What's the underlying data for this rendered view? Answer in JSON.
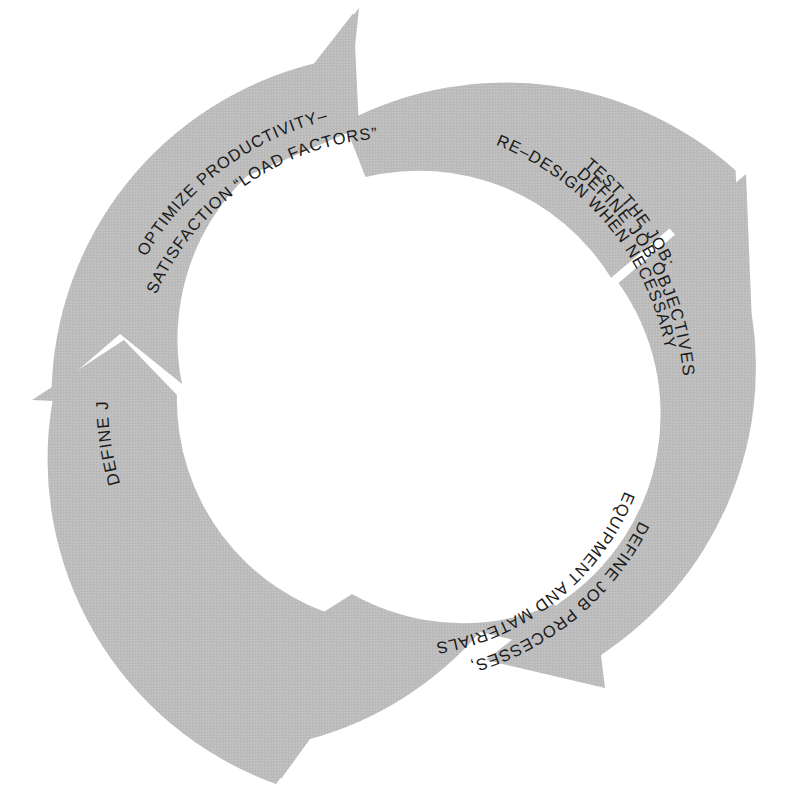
{
  "diagram": {
    "type": "cyclic-process-diagram",
    "title": "",
    "orientation": "clockwise",
    "segment_count": 5,
    "colors": {
      "background": "#ffffff",
      "arrow_fill": "#bcbcbc",
      "arrow_fill_texture": "#c2c2c2",
      "text": "#1a1a1a",
      "gap": "#ffffff"
    },
    "geometry": {
      "center_x": 396,
      "center_y": 400,
      "outer_radius": 345,
      "inner_radius": 226
    },
    "segments": [
      {
        "id": "define-job-objectives",
        "order": 1,
        "label_lines": [
          "DEFINE JOB OBJECTIVES"
        ],
        "label_full": "DEFINE JOB OBJECTIVES",
        "position": "top-right",
        "start_angle_deg": -78,
        "end_angle_deg": -8
      },
      {
        "id": "define-job-conditions",
        "order": 2,
        "label_lines": [
          "DEFINE JOB CONDITIONS"
        ],
        "label_full": "DEFINE JOB CONDITIONS",
        "position": "right",
        "start_angle_deg": -4,
        "end_angle_deg": 62
      },
      {
        "id": "define-job-processes",
        "order": 3,
        "label_lines": [
          "DEFINE JOB PROCESSES,",
          "EQUIPMENT AND MATERIALS"
        ],
        "label_full": "DEFINE JOB PROCESSES, EQUIPMENT AND MATERIALS",
        "position": "bottom",
        "start_angle_deg": 66,
        "end_angle_deg": 140
      },
      {
        "id": "optimize-productivity",
        "order": 4,
        "label_lines": [
          "OPTIMIZE PRODUCTIVITY–",
          "SATISFACTION “LOAD FACTORS”"
        ],
        "label_full": "OPTIMIZE PRODUCTIVITY– SATISFACTION “LOAD FACTORS”",
        "position": "left",
        "start_angle_deg": 144,
        "end_angle_deg": 212
      },
      {
        "id": "test-the-job",
        "order": 5,
        "label_lines": [
          "TEST THE JOB;",
          "RE–DESIGN WHEN NECESSARY"
        ],
        "label_full": "TEST THE JOB; RE–DESIGN WHEN NECESSARY",
        "position": "top-left",
        "start_angle_deg": 216,
        "end_angle_deg": 282
      }
    ]
  }
}
